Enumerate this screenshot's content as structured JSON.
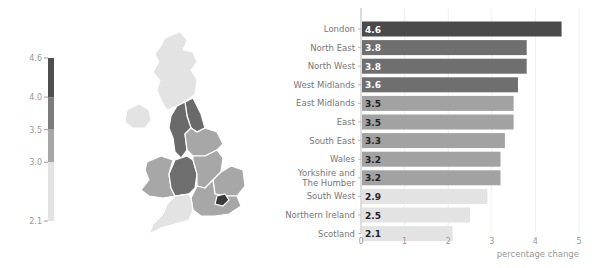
{
  "chart_data": [
    {
      "type": "choropleth-legend",
      "title": "",
      "ticks": [
        "4.6",
        "4.0",
        "3.5",
        "3.0",
        "2.1"
      ],
      "tick_values": [
        4.6,
        4.0,
        3.5,
        3.0,
        2.1
      ],
      "bins": [
        {
          "from": 4.0,
          "to": 4.6,
          "color": "#4f4f4f"
        },
        {
          "from": 3.5,
          "to": 4.0,
          "color": "#7c7c7c"
        },
        {
          "from": 3.0,
          "to": 3.5,
          "color": "#a7a7a7"
        },
        {
          "from": 2.1,
          "to": 3.0,
          "color": "#e3e3e3"
        }
      ]
    },
    {
      "type": "map",
      "title": "",
      "regions": [
        {
          "name": "Scotland",
          "value": 2.1,
          "color": "#e3e3e3"
        },
        {
          "name": "Northern Ireland",
          "value": 2.5,
          "color": "#e3e3e3"
        },
        {
          "name": "North East",
          "value": 3.8,
          "color": "#6a6a6a"
        },
        {
          "name": "North West",
          "value": 3.8,
          "color": "#6a6a6a"
        },
        {
          "name": "Yorkshire and The Humber",
          "value": 3.2,
          "color": "#a7a7a7"
        },
        {
          "name": "West Midlands",
          "value": 3.6,
          "color": "#6e6e6e"
        },
        {
          "name": "East Midlands",
          "value": 3.5,
          "color": "#a7a7a7"
        },
        {
          "name": "Wales",
          "value": 3.2,
          "color": "#a7a7a7"
        },
        {
          "name": "East",
          "value": 3.5,
          "color": "#a7a7a7"
        },
        {
          "name": "London",
          "value": 4.6,
          "color": "#3a3a3a"
        },
        {
          "name": "South East",
          "value": 3.3,
          "color": "#a7a7a7"
        },
        {
          "name": "South West",
          "value": 2.9,
          "color": "#e3e3e3"
        }
      ]
    },
    {
      "type": "bar",
      "orientation": "horizontal",
      "title": "",
      "xlabel": "percentage change",
      "ylabel": "",
      "xlim": [
        0,
        5
      ],
      "xticks": [
        "0",
        "1",
        "2",
        "3",
        "4",
        "5"
      ],
      "grid": true,
      "categories": [
        "London",
        "North East",
        "North West",
        "West Midlands",
        "East Midlands",
        "East",
        "South East",
        "Wales",
        "Yorkshire and The Humber",
        "South West",
        "Northern Ireland",
        "Scotland"
      ],
      "category_lines": [
        [
          "London"
        ],
        [
          "North East"
        ],
        [
          "North West"
        ],
        [
          "West Midlands"
        ],
        [
          "East Midlands"
        ],
        [
          "East"
        ],
        [
          "South East"
        ],
        [
          "Wales"
        ],
        [
          "Yorkshire and",
          "The Humber"
        ],
        [
          "South West"
        ],
        [
          "Northern Ireland"
        ],
        [
          "Scotland"
        ]
      ],
      "values": [
        4.6,
        3.8,
        3.8,
        3.6,
        3.5,
        3.5,
        3.3,
        3.2,
        3.2,
        2.9,
        2.5,
        2.1
      ],
      "value_labels": [
        "4.6",
        "3.8",
        "3.8",
        "3.6",
        "3.5",
        "3.5",
        "3.3",
        "3.2",
        "3.2",
        "2.9",
        "2.5",
        "2.1"
      ],
      "colors": [
        "#4a4a4a",
        "#6f6f6f",
        "#6f6f6f",
        "#6f6f6f",
        "#a2a2a2",
        "#a2a2a2",
        "#a2a2a2",
        "#a2a2a2",
        "#a2a2a2",
        "#e3e3e3",
        "#e3e3e3",
        "#e3e3e3"
      ],
      "label_colors": [
        "#ffffff",
        "#ffffff",
        "#ffffff",
        "#ffffff",
        "#222222",
        "#222222",
        "#222222",
        "#222222",
        "#222222",
        "#222222",
        "#222222",
        "#222222"
      ]
    }
  ]
}
